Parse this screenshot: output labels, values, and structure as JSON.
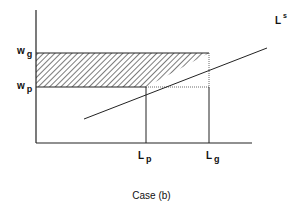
{
  "diagram": {
    "type": "labor-supply-wage-diagram",
    "caption": "Case (b)",
    "y_axis": {
      "ticks": [
        {
          "main": "w",
          "sub": "g"
        },
        {
          "main": "w",
          "sub": "p"
        }
      ]
    },
    "x_axis": {
      "ticks": [
        {
          "main": "L",
          "sub": "p"
        },
        {
          "main": "L",
          "sub": "g"
        }
      ]
    },
    "curve_label": {
      "main": "L",
      "sup": "s"
    },
    "shaded_region": "hatched area between w_p and w_g bounded by y-axis and supply curve"
  }
}
